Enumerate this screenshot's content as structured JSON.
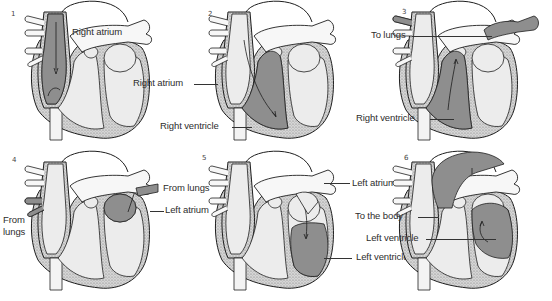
{
  "figure": {
    "title": "",
    "colors": {
      "background": "#ffffff",
      "outline": "#1e1e1e",
      "wall_stipple": "#bdbdbd",
      "chamber": "#ececec",
      "blood_highlight": "#8e8e8e"
    },
    "panels": [
      {
        "number": "1",
        "highlight": "right-atrium",
        "labels": [
          {
            "text": "Right atrium"
          }
        ]
      },
      {
        "number": "2",
        "highlight": "right-ventricle",
        "labels": [
          {
            "text": "Right atrium"
          },
          {
            "text": "Right ventricle"
          }
        ]
      },
      {
        "number": "3",
        "highlight": "pulmonary-artery",
        "labels": [
          {
            "text": "To lungs"
          },
          {
            "text": "Right ventricle"
          }
        ]
      },
      {
        "number": "4",
        "highlight": "left-atrium",
        "labels": [
          {
            "text": "From lungs"
          },
          {
            "text": "Left atrium"
          },
          {
            "text": "From\nlungs"
          }
        ]
      },
      {
        "number": "5",
        "highlight": "left-ventricle",
        "labels": [
          {
            "text": "Left atrium"
          },
          {
            "text": "Left ventricle"
          }
        ]
      },
      {
        "number": "6",
        "highlight": "aorta",
        "labels": [
          {
            "text": "To the body"
          },
          {
            "text": "Left ventricle"
          }
        ]
      }
    ],
    "text": {
      "p1_right_atrium": "Right atrium",
      "p2_right_atrium": "Right atrium",
      "p2_right_ventricle": "Right ventricle",
      "p3_to_lungs": "To lungs",
      "p3_right_ventricle": "Right ventricle",
      "p4_from_lungs_right": "From lungs",
      "p4_left_atrium": "Left atrium",
      "p4_from_lungs_left_1": "From",
      "p4_from_lungs_left_2": "lungs",
      "p5_left_atrium": "Left atrium",
      "p5_to_the_body": "To the body",
      "p5_left_ventricle": "Left ventricle",
      "p5_left_ventricle_2": "Left ventricle"
    },
    "numbers": [
      "1",
      "2",
      "3",
      "4",
      "5",
      "6"
    ]
  }
}
